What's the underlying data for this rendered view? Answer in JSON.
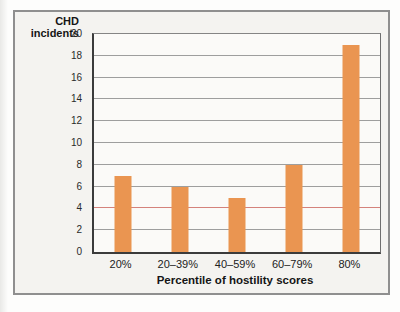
{
  "page": {
    "background": "#fdfdfc"
  },
  "card": {
    "background": "#f4f3f0",
    "border_color": "#8f8f8f"
  },
  "chart_data": {
    "type": "bar",
    "title": "",
    "ylabel": "CHD incidents",
    "ylabel_lines": [
      "CHD",
      "incidents"
    ],
    "xlabel": "Percentile of hostility scores",
    "categories": [
      "20%",
      "20–39%",
      "40–59%",
      "60–79%",
      "80%"
    ],
    "values": [
      7,
      6,
      5,
      8,
      19
    ],
    "ylim": [
      0,
      20
    ],
    "yticks": [
      0,
      2,
      4,
      6,
      8,
      10,
      12,
      14,
      16,
      18,
      20
    ],
    "ytick_step": 2,
    "grid": "on",
    "legend": "none",
    "bar_color": "#EA9551",
    "bar_width_px": 17,
    "grid_color": "#9e9e9e",
    "axis_color": "#3b3b3b",
    "text_color": "#1c1c1c",
    "highlight_gridline": {
      "value": 4,
      "color": "#d4827c"
    }
  }
}
